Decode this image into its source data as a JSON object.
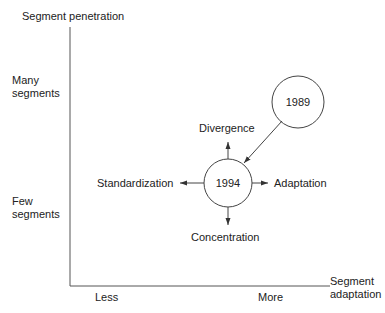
{
  "axes": {
    "y_title": "Segment penetration",
    "y_high": [
      "Many",
      "segments"
    ],
    "y_low": [
      "Few",
      "segments"
    ],
    "x_title": [
      "Segment",
      "adaptation"
    ],
    "x_low": "Less",
    "x_high": "More"
  },
  "nodes": {
    "past": "1989",
    "current": "1994"
  },
  "strategies": {
    "up": "Divergence",
    "left": "Standardization",
    "right": "Adaptation",
    "down": "Concentration"
  },
  "colors": {
    "line": "#444444",
    "text": "#222222"
  }
}
